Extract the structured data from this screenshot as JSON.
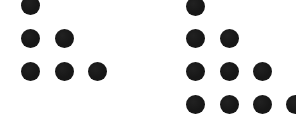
{
  "figure": {
    "background_color": "#ffffff",
    "dot_color": "#171717",
    "dot_diameter": 19,
    "canvas": {
      "width": 296,
      "height": 135
    }
  },
  "chart_data": {
    "type": "scatter",
    "subtitle": "",
    "xlabel": "",
    "ylabel": "",
    "grid": false,
    "legend": "none",
    "xlim": [
      0,
      296
    ],
    "ylim": [
      0,
      135
    ],
    "marker": "filled-circle",
    "marker_size": 19,
    "marker_color": "#171717",
    "series": [
      {
        "name": "left-triangle",
        "rows": 3,
        "dot_count": 6,
        "row_counts": [
          1,
          2,
          3
        ],
        "row_label": "T3 = 6",
        "points": [
          {
            "x": 30,
            "y": 5,
            "row": 1,
            "col": 1,
            "clipped": "top"
          },
          {
            "x": 30,
            "y": 38,
            "row": 2,
            "col": 1,
            "clipped": "none"
          },
          {
            "x": 64,
            "y": 38,
            "row": 2,
            "col": 2,
            "clipped": "none"
          },
          {
            "x": 30,
            "y": 71,
            "row": 3,
            "col": 1,
            "clipped": "none"
          },
          {
            "x": 64,
            "y": 71,
            "row": 3,
            "col": 2,
            "clipped": "none"
          },
          {
            "x": 97,
            "y": 71,
            "row": 3,
            "col": 3,
            "clipped": "none"
          }
        ]
      },
      {
        "name": "right-triangle",
        "rows": 4,
        "dot_count": 10,
        "row_counts": [
          1,
          2,
          3,
          4
        ],
        "row_label": "T4 = 10",
        "points": [
          {
            "x": 195,
            "y": 6,
            "row": 1,
            "col": 1,
            "clipped": "top"
          },
          {
            "x": 195,
            "y": 38,
            "row": 2,
            "col": 1,
            "clipped": "none"
          },
          {
            "x": 229,
            "y": 38,
            "row": 2,
            "col": 2,
            "clipped": "none"
          },
          {
            "x": 195,
            "y": 71,
            "row": 3,
            "col": 1,
            "clipped": "none"
          },
          {
            "x": 229,
            "y": 71,
            "row": 3,
            "col": 2,
            "clipped": "none"
          },
          {
            "x": 262,
            "y": 71,
            "row": 3,
            "col": 3,
            "clipped": "none"
          },
          {
            "x": 195,
            "y": 104,
            "row": 4,
            "col": 1,
            "clipped": "none"
          },
          {
            "x": 229,
            "y": 104,
            "row": 4,
            "col": 2,
            "clipped": "none"
          },
          {
            "x": 262,
            "y": 104,
            "row": 4,
            "col": 3,
            "clipped": "none"
          },
          {
            "x": 295,
            "y": 104,
            "row": 4,
            "col": 4,
            "clipped": "right"
          }
        ]
      }
    ]
  }
}
